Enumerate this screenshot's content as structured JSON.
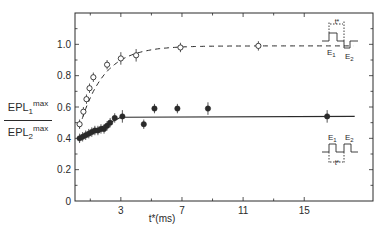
{
  "chart_data": {
    "type": "scatter",
    "title": "",
    "xlabel": "t* (ms)",
    "ylabel": "EPL1max / EPL2max",
    "ylabel_parts": {
      "numerator_base": "EPL",
      "numerator_sub": "1",
      "numerator_sup": "max",
      "denominator_base": "EPL",
      "denominator_sub": "2",
      "denominator_sup": "max"
    },
    "xlim": [
      0,
      19.5
    ],
    "ylim": [
      0,
      1.2
    ],
    "x_ticks_major": [
      3,
      7,
      11,
      15
    ],
    "x_tick_labels": [
      "3",
      "7",
      "11",
      "15"
    ],
    "x_ticks_minor": [
      1,
      5,
      9,
      13
    ],
    "y_ticks": [
      0,
      0.2,
      0.4,
      0.6,
      0.8,
      1.0
    ],
    "y_tick_labels": [
      "0",
      "0.2",
      "0.4",
      "0.6",
      "0.8",
      "1.0"
    ],
    "grid": false,
    "series": [
      {
        "name": "Open circles (E1 precedes E2)",
        "marker": "open-circle",
        "fit_line": "dashed",
        "points": [
          {
            "x": 0.3,
            "y": 0.49,
            "err": 0.03
          },
          {
            "x": 0.55,
            "y": 0.57,
            "err": 0.03
          },
          {
            "x": 0.75,
            "y": 0.65,
            "err": 0.03
          },
          {
            "x": 0.95,
            "y": 0.72,
            "err": 0.03
          },
          {
            "x": 1.2,
            "y": 0.79,
            "err": 0.03
          },
          {
            "x": 2.1,
            "y": 0.87,
            "err": 0.03
          },
          {
            "x": 3.0,
            "y": 0.91,
            "err": 0.04
          },
          {
            "x": 4.0,
            "y": 0.93,
            "err": 0.04
          },
          {
            "x": 6.9,
            "y": 0.98,
            "err": 0.03
          },
          {
            "x": 12.0,
            "y": 0.99,
            "err": 0.03
          }
        ],
        "fit_plateau": 0.99
      },
      {
        "name": "Filled circles (E2 precedes E1)",
        "marker": "filled-circle",
        "fit_line": "solid",
        "points": [
          {
            "x": 0.3,
            "y": 0.4,
            "err": 0.03
          },
          {
            "x": 0.5,
            "y": 0.41,
            "err": 0.03
          },
          {
            "x": 0.7,
            "y": 0.42,
            "err": 0.03
          },
          {
            "x": 0.9,
            "y": 0.43,
            "err": 0.03
          },
          {
            "x": 1.1,
            "y": 0.44,
            "err": 0.03
          },
          {
            "x": 1.3,
            "y": 0.45,
            "err": 0.03
          },
          {
            "x": 1.5,
            "y": 0.45,
            "err": 0.03
          },
          {
            "x": 1.7,
            "y": 0.46,
            "err": 0.03
          },
          {
            "x": 1.9,
            "y": 0.46,
            "err": 0.03
          },
          {
            "x": 2.1,
            "y": 0.48,
            "err": 0.03
          },
          {
            "x": 2.3,
            "y": 0.5,
            "err": 0.03
          },
          {
            "x": 2.6,
            "y": 0.53,
            "err": 0.03
          },
          {
            "x": 3.1,
            "y": 0.54,
            "err": 0.04
          },
          {
            "x": 4.5,
            "y": 0.49,
            "err": 0.03
          },
          {
            "x": 5.2,
            "y": 0.59,
            "err": 0.03
          },
          {
            "x": 6.7,
            "y": 0.59,
            "err": 0.03
          },
          {
            "x": 8.7,
            "y": 0.59,
            "err": 0.04
          },
          {
            "x": 16.5,
            "y": 0.54,
            "err": 0.04
          }
        ],
        "fit_plateau": 0.54
      }
    ],
    "annotations": [
      {
        "text": "E1 then E2 pulse diagram (t* between E1 up-step and E2 down-step)",
        "position": "upper-right",
        "labels": [
          "E1",
          "E2",
          "t*"
        ]
      },
      {
        "text": "E1 then E2 pulse diagram (both up-steps, t* between)",
        "position": "lower-right",
        "labels": [
          "E1",
          "E2",
          "t*"
        ]
      }
    ]
  },
  "labels": {
    "x_axis": "t*(ms)",
    "y_num_base": "EPL",
    "y_num_sub": "1",
    "y_num_sup": "max",
    "y_den_base": "EPL",
    "y_den_sub": "2",
    "y_den_sup": "max",
    "upper_e1": "E",
    "upper_e1_sub": "1",
    "upper_e2": "E",
    "upper_e2_sub": "2",
    "lower_e1": "E",
    "lower_e1_sub": "1",
    "lower_e2": "E",
    "lower_e2_sub": "2",
    "tstar": "t*"
  }
}
